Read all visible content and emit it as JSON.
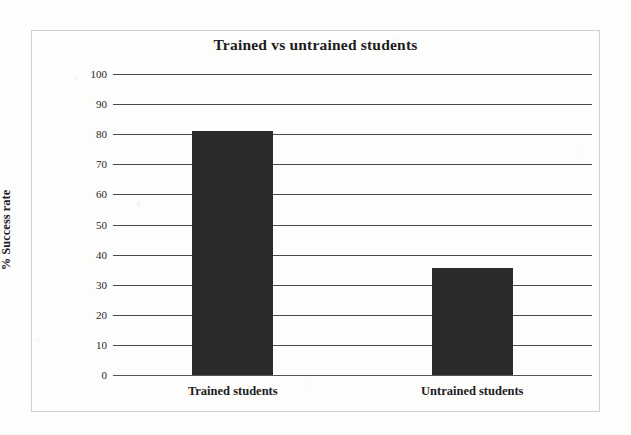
{
  "chart_data": {
    "type": "bar",
    "title": "Trained vs untrained students",
    "xlabel": "",
    "ylabel": "% Success rate",
    "categories": [
      "Trained students",
      "Untrained students"
    ],
    "values": [
      81,
      35.5
    ],
    "ylim": [
      0,
      100
    ],
    "yticks": [
      0,
      10,
      20,
      30,
      40,
      50,
      60,
      70,
      80,
      90,
      100
    ],
    "ytick_labels": [
      "0",
      "10",
      "20",
      "30",
      "40",
      "50",
      "60",
      "70",
      "80",
      "90",
      "100"
    ],
    "grid": true,
    "legend": false,
    "bar_color": "#2b2b2b",
    "gridline_color": "#4a4a4a",
    "frame_color": "#cfcfcf",
    "text_color": "#1c1c1c",
    "background_color": "#fdfdfc"
  }
}
